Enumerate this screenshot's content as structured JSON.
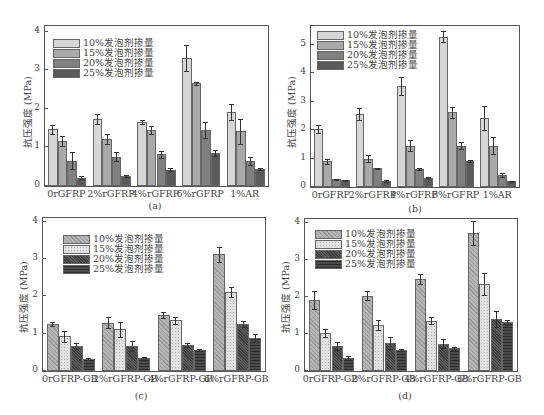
{
  "chart_data": [
    {
      "id": "a",
      "type": "bar",
      "caption": "(a)",
      "ylabel": "抗压强度 (MPa)",
      "xlabel": "",
      "ylim": [
        0,
        4
      ],
      "yticks": [
        "0",
        "1",
        "2",
        "3",
        "4"
      ],
      "grid": false,
      "legend_position": "upper-left",
      "categories": [
        "0rGFRP",
        "2%rGFRP",
        "4%rGFRP",
        "6%rGFRP",
        "1%AR"
      ],
      "series": [
        {
          "name": "10%发泡剂掺量",
          "color": "#d6d6d6",
          "values": [
            1.47,
            1.73,
            1.66,
            3.32,
            1.92
          ],
          "errors": [
            0.12,
            0.13,
            0.06,
            0.35,
            0.21
          ]
        },
        {
          "name": "15%发泡剂掺量",
          "color": "#a9a9a9",
          "values": [
            1.16,
            1.22,
            1.46,
            2.66,
            1.42
          ],
          "errors": [
            0.13,
            0.12,
            0.1,
            0.04,
            0.33
          ]
        },
        {
          "name": "20%发泡剂掺量",
          "color": "#808080",
          "values": [
            0.66,
            0.76,
            0.82,
            1.45,
            0.65
          ],
          "errors": [
            0.22,
            0.11,
            0.1,
            0.21,
            0.1
          ]
        },
        {
          "name": "25%发泡剂掺量",
          "color": "#5a5a5a",
          "values": [
            0.22,
            0.26,
            0.42,
            0.86,
            0.44
          ],
          "errors": [
            0.03,
            0.02,
            0.04,
            0.08,
            0.02
          ]
        }
      ]
    },
    {
      "id": "b",
      "type": "bar",
      "caption": "(b)",
      "ylabel": "抗压强度 (MPa)",
      "xlabel": "",
      "ylim": [
        0,
        5.6
      ],
      "yticks": [
        "0",
        "1",
        "2",
        "3",
        "4",
        "5"
      ],
      "grid": false,
      "legend_position": "upper-left",
      "categories": [
        "0rGFRP",
        "2%rGFRP",
        "4%rGFRP",
        "6%rGFRP",
        "1%AR"
      ],
      "series": [
        {
          "name": "10%发泡剂掺量",
          "color": "#d6d6d6",
          "values": [
            2.03,
            2.56,
            3.54,
            5.28,
            2.41
          ],
          "errors": [
            0.15,
            0.22,
            0.32,
            0.18,
            0.42
          ]
        },
        {
          "name": "15%发泡剂掺量",
          "color": "#a9a9a9",
          "values": [
            0.9,
            1.0,
            1.45,
            2.62,
            1.45
          ],
          "errors": [
            0.1,
            0.14,
            0.2,
            0.2,
            0.3
          ]
        },
        {
          "name": "20%发泡剂掺量",
          "color": "#808080",
          "values": [
            0.27,
            0.66,
            0.63,
            1.45,
            0.41
          ],
          "errors": [
            0.02,
            0.02,
            0.02,
            0.12,
            0.07
          ]
        },
        {
          "name": "25%发泡剂掺量",
          "color": "#5a5a5a",
          "values": [
            0.23,
            0.22,
            0.33,
            0.91,
            0.2
          ],
          "errors": [
            0.02,
            0.04,
            0.02,
            0.03,
            0.02
          ]
        }
      ]
    },
    {
      "id": "c",
      "type": "bar",
      "caption": "(c)",
      "ylabel": "抗压强度 (MPa)",
      "xlabel": "",
      "ylim": [
        0,
        4.1
      ],
      "yticks": [
        "0",
        "1",
        "2",
        "3",
        "4"
      ],
      "grid": false,
      "legend_position": "upper-left",
      "categories": [
        "0rGFRP-GB",
        "2%rGFRP-GB",
        "4%rGFRP-GB",
        "6%rGFRP-GB"
      ],
      "series": [
        {
          "name": "10%发泡剂掺量",
          "pattern": "diagonal-hatch",
          "color": "#a8a8a8",
          "values": [
            1.25,
            1.29,
            1.51,
            3.13
          ],
          "errors": [
            0.05,
            0.15,
            0.08,
            0.2
          ]
        },
        {
          "name": "15%发泡剂掺量",
          "pattern": "dots",
          "color": "#dcdcdc",
          "values": [
            0.93,
            1.12,
            1.36,
            2.12
          ],
          "errors": [
            0.15,
            0.2,
            0.1,
            0.13
          ]
        },
        {
          "name": "20%发泡剂掺量",
          "pattern": "crosshatch-dark",
          "color": "#4a4a4a",
          "values": [
            0.68,
            0.67,
            0.7,
            1.25
          ],
          "errors": [
            0.08,
            0.14,
            0.05,
            0.08
          ]
        },
        {
          "name": "25%发泡剂掺量",
          "pattern": "brick-dark",
          "color": "#3a3a3a",
          "values": [
            0.33,
            0.36,
            0.56,
            0.88
          ],
          "errors": [
            0.03,
            0.02,
            0.02,
            0.11
          ]
        }
      ]
    },
    {
      "id": "d",
      "type": "bar",
      "caption": "(d)",
      "ylabel": "抗压强度 (MPa)",
      "xlabel": "",
      "ylim": [
        0,
        4.1
      ],
      "yticks": [
        "0",
        "1",
        "2",
        "3",
        "4"
      ],
      "grid": false,
      "legend_position": "upper-left",
      "categories": [
        "0rGFRP-GB",
        "2%rGFRP-GB",
        "4%rGFRP-GB",
        "6%rGFRP-GB"
      ],
      "series": [
        {
          "name": "10%发泡剂掺量",
          "pattern": "diagonal-hatch",
          "color": "#a8a8a8",
          "values": [
            1.91,
            2.03,
            2.48,
            3.73
          ],
          "errors": [
            0.24,
            0.12,
            0.14,
            0.32
          ]
        },
        {
          "name": "15%发泡剂掺量",
          "pattern": "dots",
          "color": "#dcdcdc",
          "values": [
            1.03,
            1.24,
            1.36,
            2.34
          ],
          "errors": [
            0.1,
            0.14,
            0.1,
            0.3
          ]
        },
        {
          "name": "20%发泡剂掺量",
          "pattern": "crosshatch-dark",
          "color": "#4a4a4a",
          "values": [
            0.67,
            0.76,
            0.74,
            1.4
          ],
          "errors": [
            0.11,
            0.17,
            0.12,
            0.21
          ]
        },
        {
          "name": "25%发泡剂掺量",
          "pattern": "brick-dark",
          "color": "#3a3a3a",
          "values": [
            0.35,
            0.56,
            0.61,
            1.31
          ],
          "errors": [
            0.06,
            0.02,
            0.05,
            0.07
          ]
        }
      ]
    }
  ]
}
